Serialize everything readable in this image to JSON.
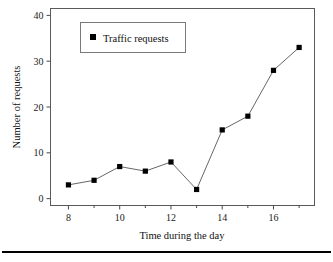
{
  "chart_data": {
    "type": "line",
    "title": "",
    "xlabel": "Time during the day",
    "ylabel": "Number of requests",
    "x": [
      8,
      9,
      10,
      11,
      12,
      13,
      14,
      15,
      16,
      17
    ],
    "series": [
      {
        "name": "Traffic requests",
        "values": [
          3,
          4,
          7,
          6,
          8,
          2,
          15,
          18,
          28,
          33
        ],
        "marker": "square",
        "marker_color": "#000000",
        "line_color": "#555555"
      }
    ],
    "xlim": [
      7.3,
      17.6
    ],
    "ylim": [
      -1.5,
      41.5
    ],
    "xticks": [
      8,
      10,
      12,
      14,
      16
    ],
    "xticks_minor": [
      9,
      11,
      13,
      15,
      17
    ],
    "yticks": [
      0,
      10,
      20,
      30,
      40
    ],
    "xtick_labels": [
      "8",
      "10",
      "12",
      "14",
      "16"
    ],
    "ytick_labels": [
      "0",
      "10",
      "20",
      "30",
      "40"
    ],
    "grid": false,
    "legend_position": "upper left",
    "legend_entries": [
      "Traffic requests"
    ]
  },
  "legend": {
    "entry_label": "Traffic requests"
  },
  "axes": {
    "x_title": "Time during the day",
    "y_title": "Number of requests"
  }
}
